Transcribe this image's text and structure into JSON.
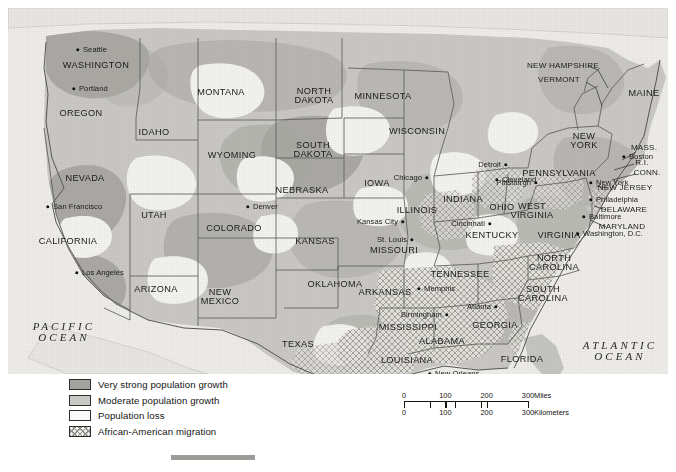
{
  "figure": {
    "name": "us-population-growth-and-african-american-migration-map",
    "bottom_rule": ""
  },
  "oceans": [
    {
      "name": "pacific-ocean",
      "line1": "PACIFIC",
      "line2": "OCEAN",
      "x": 56,
      "y": 324
    },
    {
      "name": "atlantic-ocean",
      "line1": "ATLANTIC",
      "line2": "OCEAN",
      "x": 612,
      "y": 343
    },
    {
      "name": "gulf-of-mexico",
      "text": "GULF OF MEXICO",
      "x": 422,
      "y": 398
    }
  ],
  "states": [
    {
      "label": "WASHINGTON",
      "x": 88,
      "y": 58,
      "size": ""
    },
    {
      "label": "OREGON",
      "x": 73,
      "y": 106,
      "size": ""
    },
    {
      "label": "IDAHO",
      "x": 146,
      "y": 125,
      "size": ""
    },
    {
      "label": "MONTANA",
      "x": 213,
      "y": 85,
      "size": ""
    },
    {
      "label": "WYOMING",
      "x": 224,
      "y": 148,
      "size": ""
    },
    {
      "label": "NORTH\nDAKOTA",
      "x": 306,
      "y": 88,
      "size": ""
    },
    {
      "label": "SOUTH\nDAKOTA",
      "x": 305,
      "y": 142,
      "size": ""
    },
    {
      "label": "MINNESOTA",
      "x": 375,
      "y": 89,
      "size": ""
    },
    {
      "label": "WISCONSIN",
      "x": 409,
      "y": 124,
      "size": ""
    },
    {
      "label": "NEBRASKA",
      "x": 294,
      "y": 183,
      "size": ""
    },
    {
      "label": "IOWA",
      "x": 369,
      "y": 176,
      "size": ""
    },
    {
      "label": "NEVADA",
      "x": 77,
      "y": 171,
      "size": ""
    },
    {
      "label": "UTAH",
      "x": 146,
      "y": 208,
      "size": ""
    },
    {
      "label": "CALIFORNIA",
      "x": 60,
      "y": 234,
      "size": ""
    },
    {
      "label": "COLORADO",
      "x": 226,
      "y": 221,
      "size": ""
    },
    {
      "label": "KANSAS",
      "x": 307,
      "y": 234,
      "size": ""
    },
    {
      "label": "MISSOURI",
      "x": 386,
      "y": 243,
      "size": ""
    },
    {
      "label": "ILLINOIS",
      "x": 409,
      "y": 203,
      "size": ""
    },
    {
      "label": "INDIANA",
      "x": 455,
      "y": 192,
      "size": ""
    },
    {
      "label": "OHIO",
      "x": 494,
      "y": 200,
      "size": ""
    },
    {
      "label": "ARIZONA",
      "x": 148,
      "y": 282,
      "size": ""
    },
    {
      "label": "NEW\nMEXICO",
      "x": 212,
      "y": 289,
      "size": ""
    },
    {
      "label": "OKLAHOMA",
      "x": 327,
      "y": 277,
      "size": ""
    },
    {
      "label": "ARKANSAS",
      "x": 377,
      "y": 285,
      "size": ""
    },
    {
      "label": "TEXAS",
      "x": 290,
      "y": 337,
      "size": ""
    },
    {
      "label": "LOUISIANA",
      "x": 399,
      "y": 353,
      "size": ""
    },
    {
      "label": "MISSISSIPPI",
      "x": 400,
      "y": 320,
      "size": ""
    },
    {
      "label": "ALABAMA",
      "x": 434,
      "y": 334,
      "size": ""
    },
    {
      "label": "TENNESSEE",
      "x": 452,
      "y": 267,
      "size": ""
    },
    {
      "label": "KENTUCKY",
      "x": 484,
      "y": 228,
      "size": ""
    },
    {
      "label": "GEORGIA",
      "x": 487,
      "y": 318,
      "size": ""
    },
    {
      "label": "FLORIDA",
      "x": 514,
      "y": 352,
      "size": ""
    },
    {
      "label": "SOUTH\nCAROLINA",
      "x": 535,
      "y": 286,
      "size": ""
    },
    {
      "label": "NORTH\nCAROLINA",
      "x": 546,
      "y": 255,
      "size": ""
    },
    {
      "label": "VIRGINIA",
      "x": 551,
      "y": 228,
      "size": ""
    },
    {
      "label": "WEST\nVIRGINIA",
      "x": 524,
      "y": 203,
      "size": ""
    },
    {
      "label": "PENNSYLVANIA",
      "x": 551,
      "y": 166,
      "size": ""
    },
    {
      "label": "NEW\nYORK",
      "x": 576,
      "y": 133,
      "size": ""
    },
    {
      "label": "MAINE",
      "x": 636,
      "y": 86,
      "size": ""
    },
    {
      "label": "NEW HAMPSHIRE",
      "x": 555,
      "y": 58,
      "size": "sm"
    },
    {
      "label": "VERMONT",
      "x": 551,
      "y": 72,
      "size": "sm"
    },
    {
      "label": "MASS.",
      "x": 636,
      "y": 140,
      "size": "sm"
    },
    {
      "label": "R.I.",
      "x": 634,
      "y": 155,
      "size": "sm"
    },
    {
      "label": "CONN.",
      "x": 639,
      "y": 165,
      "size": "sm"
    },
    {
      "label": "NEW JERSEY",
      "x": 617,
      "y": 180,
      "size": "sm"
    },
    {
      "label": "DELAWARE",
      "x": 616,
      "y": 202,
      "size": "sm"
    },
    {
      "label": "MARYLAND",
      "x": 614,
      "y": 219,
      "size": "sm"
    }
  ],
  "cities": [
    {
      "label": "Seattle",
      "dot_x": 70,
      "dot_y": 42,
      "side": "right"
    },
    {
      "label": "Portland",
      "dot_x": 66,
      "dot_y": 81,
      "side": "right"
    },
    {
      "label": "San Francisco",
      "dot_x": 40,
      "dot_y": 199,
      "side": "right"
    },
    {
      "label": "Los Angeles",
      "dot_x": 69,
      "dot_y": 265,
      "side": "right"
    },
    {
      "label": "Denver",
      "dot_x": 240,
      "dot_y": 199,
      "side": "right"
    },
    {
      "label": "Kansas City",
      "dot_x": 395,
      "dot_y": 214,
      "side": "left"
    },
    {
      "label": "St. Louis",
      "dot_x": 404,
      "dot_y": 232,
      "side": "left"
    },
    {
      "label": "Chicago",
      "dot_x": 419,
      "dot_y": 170,
      "side": "left"
    },
    {
      "label": "Detroit",
      "dot_x": 498,
      "dot_y": 157,
      "side": "left"
    },
    {
      "label": "Cleveland",
      "dot_x": 489,
      "dot_y": 172,
      "side": "right"
    },
    {
      "label": "Cincinnati",
      "dot_x": 482,
      "dot_y": 216,
      "side": "left"
    },
    {
      "label": "Pittsburgh",
      "dot_x": 528,
      "dot_y": 175,
      "side": "left"
    },
    {
      "label": "New York",
      "dot_x": 583,
      "dot_y": 175,
      "side": "right"
    },
    {
      "label": "Philadelphia",
      "dot_x": 583,
      "dot_y": 192,
      "side": "right"
    },
    {
      "label": "Baltimore",
      "dot_x": 576,
      "dot_y": 209,
      "side": "right"
    },
    {
      "label": "Washington, D.C.",
      "dot_x": 570,
      "dot_y": 226,
      "side": "right"
    },
    {
      "label": "Boston",
      "dot_x": 616,
      "dot_y": 149,
      "side": "right"
    },
    {
      "label": "Memphis",
      "dot_x": 411,
      "dot_y": 281,
      "side": "right"
    },
    {
      "label": "Birmingham",
      "dot_x": 439,
      "dot_y": 307,
      "side": "left"
    },
    {
      "label": "Atlanta",
      "dot_x": 488,
      "dot_y": 299,
      "side": "left"
    },
    {
      "label": "New Orleans",
      "dot_x": 422,
      "dot_y": 366,
      "side": "right"
    },
    {
      "label": "Houston",
      "dot_x": 356,
      "dot_y": 370,
      "side": "left"
    },
    {
      "label": "San Antonio",
      "dot_x": 312,
      "dot_y": 371,
      "side": "left"
    },
    {
      "label": "Miami",
      "dot_x": 556,
      "dot_y": 405,
      "side": "right"
    }
  ],
  "legend": {
    "name": "map-legend",
    "items": [
      {
        "swatch": "sw-strong",
        "label": "Very strong population growth"
      },
      {
        "swatch": "sw-moderate",
        "label": "Moderate population growth"
      },
      {
        "swatch": "sw-loss",
        "label": "Population loss"
      },
      {
        "swatch": "sw-hatch",
        "label": "African-American migration"
      }
    ]
  },
  "scale": {
    "name": "map-scale-bar",
    "miles": {
      "ticks": [
        "0",
        "100",
        "200",
        "300"
      ],
      "unit": "Miles"
    },
    "kilometers": {
      "ticks": [
        "0",
        "100",
        "200",
        "300"
      ],
      "unit": "Kilometers"
    }
  }
}
